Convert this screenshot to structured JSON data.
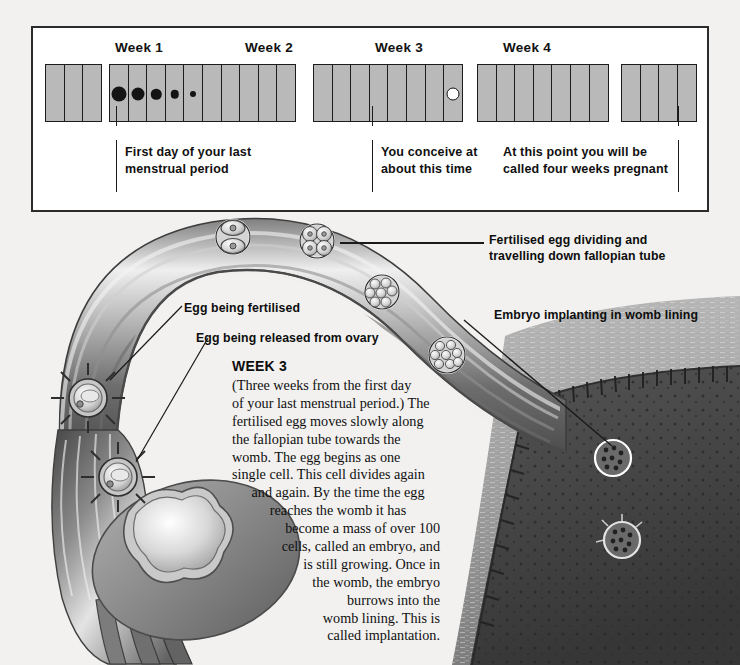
{
  "page": {
    "background": "#f2f1ef"
  },
  "calendar": {
    "week_labels": [
      {
        "text": "Week 1",
        "x": 82
      },
      {
        "text": "Week 2",
        "x": 212
      },
      {
        "text": "Week 3",
        "x": 342
      },
      {
        "text": "Week 4",
        "x": 470
      }
    ],
    "groups": [
      {
        "x": 0,
        "cells": 3,
        "width": 60
      },
      {
        "x": 64,
        "cells": 10,
        "width": 200
      },
      {
        "x": 268,
        "cells": 8,
        "width": 160
      },
      {
        "x": 432,
        "cells": 7,
        "width": 140
      },
      {
        "x": 576,
        "cells": 4,
        "width": 78
      }
    ],
    "flow_dots": [
      {
        "x": 72,
        "size": 15
      },
      {
        "x": 92,
        "size": 13
      },
      {
        "x": 112,
        "size": 10.5
      },
      {
        "x": 132,
        "size": 8.5
      },
      {
        "x": 152,
        "size": 6
      }
    ],
    "ovulation_dot": {
      "x": 328
    },
    "captions": [
      {
        "text": "First day of your last\nmenstrual period",
        "x": 113,
        "y": 146,
        "rule_x": 109,
        "rule_top": 120,
        "rule_h": 56
      },
      {
        "text": "You conceive at\nabout this time",
        "x": 361,
        "y": 146,
        "rule_x": 357,
        "rule_top": 120,
        "rule_h": 56
      },
      {
        "text": "At this point you will be\ncalled four weeks pregnant",
        "x": 500,
        "y": 146,
        "rule_x": 655,
        "rule_top": 120,
        "rule_h": 56
      }
    ],
    "colors": {
      "cell_fill": "#b9b9b9",
      "cell_border": "#1c1c1c",
      "panel_border": "#2b2b2b",
      "dot": "#141414"
    }
  },
  "callouts": [
    {
      "name": "fertilised-egg-dividing",
      "text": "Fertilised egg dividing and\ntravelling down fallopian tube",
      "x": 489,
      "y": 232
    },
    {
      "name": "embryo-implanting",
      "text": "Embryo implanting in womb lining",
      "x": 494,
      "y": 307
    },
    {
      "name": "egg-being-fertilised",
      "text": "Egg being fertilised",
      "x": 184,
      "y": 300
    },
    {
      "name": "egg-released-from-ovary",
      "text": "Egg being released from ovary",
      "x": 196,
      "y": 330
    }
  ],
  "week3": {
    "title": "WEEK 3",
    "lines": [
      {
        "t": "(Three weeks from the first day",
        "align": "left"
      },
      {
        "t": "of your last menstrual period.) The",
        "align": "left"
      },
      {
        "t": "fertilised egg moves slowly along",
        "align": "left"
      },
      {
        "t": "the fallopian tube towards the",
        "align": "left"
      },
      {
        "t": "womb. The egg begins as one",
        "align": "left"
      },
      {
        "t": "single cell. This cell divides again",
        "align": "left"
      },
      {
        "t": "and again. By the time the egg",
        "align": "center"
      },
      {
        "t": "reaches the womb it has",
        "align": "center"
      },
      {
        "t": "become a mass of over 100",
        "align": "right"
      },
      {
        "t": "cells, called an embryo, and",
        "align": "right"
      },
      {
        "t": "is still growing. Once in",
        "align": "right"
      },
      {
        "t": "the womb, the embryo",
        "align": "right"
      },
      {
        "t": "burrows into the",
        "align": "right"
      },
      {
        "t": "womb lining. This is",
        "align": "right"
      },
      {
        "t": "called implantation.",
        "align": "right"
      }
    ]
  },
  "illustration": {
    "embryo_stages": [
      {
        "name": "two-cell-stage",
        "cx": 233,
        "cy": 237,
        "r": 17
      },
      {
        "name": "four-cell-stage",
        "cx": 317,
        "cy": 241,
        "r": 17
      },
      {
        "name": "morula-early",
        "cx": 382,
        "cy": 292,
        "r": 17
      },
      {
        "name": "morula-late",
        "cx": 447,
        "cy": 355,
        "r": 18
      }
    ],
    "ova": [
      {
        "name": "egg-being-fertilised",
        "cx": 88,
        "cy": 398,
        "r": 19
      },
      {
        "name": "egg-released-from-ovary",
        "cx": 118,
        "cy": 477,
        "r": 19
      }
    ],
    "implanting_embryos": [
      {
        "name": "embryo-blastocyst-upper",
        "cx": 613,
        "cy": 458,
        "r": 18
      },
      {
        "name": "embryo-implanted-lower",
        "cx": 622,
        "cy": 540,
        "r": 18
      }
    ],
    "colors": {
      "tube_dark": "#5a5a5a",
      "tube_mid": "#8e8e8e",
      "tube_light": "#d9d9d9",
      "womb_muscle": "#9a9a9a",
      "womb_lining": "#4a4a4a",
      "ovary": "#8a8a8a",
      "background": "#f2f1ef"
    }
  }
}
